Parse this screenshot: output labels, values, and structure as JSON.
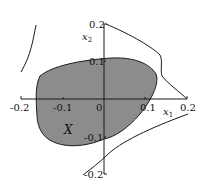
{
  "figure": {
    "type": "region-diagram",
    "colors": {
      "region_fill": "#8c8c8c",
      "stroke": "#1a1a1a",
      "background": "#ffffff"
    },
    "axes": {
      "x": {
        "label": "x",
        "label_sub": "1",
        "range": [
          -0.2,
          0.2
        ],
        "ticks": [
          "-0.2",
          "-0.1",
          "0",
          "0.1",
          "0.2"
        ]
      },
      "y": {
        "label": "x",
        "label_sub": "2",
        "range": [
          -0.2,
          0.2
        ],
        "ticks": [
          "0.2",
          "0.1",
          "-0.1",
          "-0.2"
        ]
      }
    },
    "region": {
      "label": "X",
      "description": "shaded convex-like set"
    },
    "curves": [
      "upper-left boundary arc",
      "upper-right boundary curve",
      "lower-right boundary curve"
    ]
  }
}
